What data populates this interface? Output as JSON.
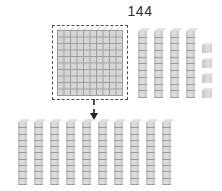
{
  "title": "144",
  "blocks": {
    "hundred_flats": {
      "count": 1,
      "rows": 10,
      "cols": 10
    },
    "tens_right": {
      "count": 4,
      "segments_per_rod": 10
    },
    "ones": {
      "count": 4
    },
    "tens_bottom": {
      "count": 10,
      "segments_per_rod": 10
    }
  },
  "arrow": {
    "icon": "arrow-down",
    "style": "dashed"
  },
  "colors": {
    "background": "#ffffff",
    "block_fill": "#d6d6d6",
    "block_line": "#9c9c9c",
    "outline": "#4d4d4d",
    "text": "#2e2e2e"
  }
}
